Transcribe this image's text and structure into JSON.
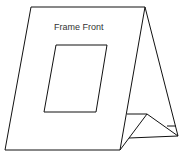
{
  "diagram": {
    "label": "Frame Front",
    "stroke_color": "#111111",
    "background": "#ffffff"
  }
}
